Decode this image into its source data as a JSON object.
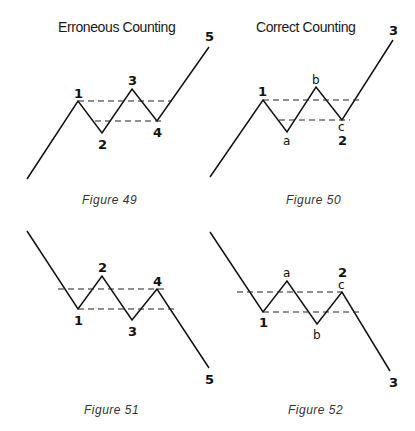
{
  "headings": {
    "left": "Erroneous Counting",
    "right": "Correct Counting"
  },
  "figures": [
    {
      "caption": "Figure 49",
      "wave_points": "27,179 78,101 102,133 132,89 157,121 209,47",
      "dashed_lines": [
        {
          "x1": 78,
          "y1": 101,
          "x2": 172,
          "y2": 101
        },
        {
          "x1": 95,
          "y1": 121,
          "x2": 165,
          "y2": 121
        }
      ],
      "labels": [
        "1",
        "2",
        "3",
        "4",
        "5"
      ]
    },
    {
      "caption": "Figure 50",
      "wave_points": "210,177 263,100 287,132 316,87 342,120 393,40",
      "dashed_lines": [
        {
          "x1": 263,
          "y1": 100,
          "x2": 360,
          "y2": 100
        },
        {
          "x1": 279,
          "y1": 120,
          "x2": 350,
          "y2": 120
        }
      ],
      "labels": [
        "1",
        "a",
        "b",
        "c",
        "2",
        "3"
      ]
    },
    {
      "caption": "Figure 51",
      "wave_points": "27,231 78,309 102,276 132,320 157,289 209,368",
      "dashed_lines": [
        {
          "x1": 58,
          "y1": 289,
          "x2": 167,
          "y2": 289
        },
        {
          "x1": 78,
          "y1": 309,
          "x2": 175,
          "y2": 309
        }
      ],
      "labels": [
        "1",
        "2",
        "3",
        "4",
        "5"
      ]
    },
    {
      "caption": "Figure 52",
      "wave_points": "210,232 263,312 287,281 317,324 342,292 390,371",
      "dashed_lines": [
        {
          "x1": 237,
          "y1": 292,
          "x2": 342,
          "y2": 292
        },
        {
          "x1": 263,
          "y1": 312,
          "x2": 362,
          "y2": 312
        }
      ],
      "labels": [
        "a",
        "2",
        "c",
        "1",
        "b",
        "3"
      ]
    }
  ]
}
